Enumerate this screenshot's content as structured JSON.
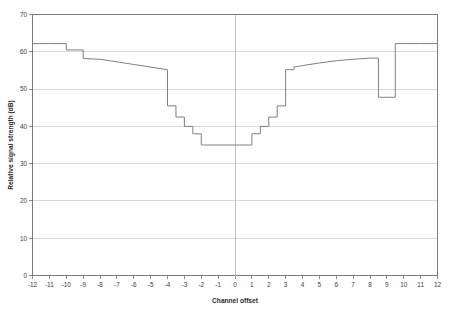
{
  "chart_data": {
    "type": "line",
    "title": "",
    "xlabel": "Channel offset",
    "ylabel": "Relative signal strength (dB)",
    "xlim": [
      -12,
      12
    ],
    "ylim": [
      0,
      70
    ],
    "xticks": [
      "-12",
      "-11",
      "-10",
      "-9",
      "-8",
      "-7",
      "-6",
      "-5",
      "-4",
      "-3",
      "-2",
      "-1",
      "0",
      "1",
      "2",
      "3",
      "4",
      "5",
      "6",
      "7",
      "8",
      "9",
      "10",
      "11",
      "12"
    ],
    "yticks": [
      "0",
      "10",
      "20",
      "30",
      "40",
      "50",
      "60",
      "70"
    ],
    "grid": "horizontal",
    "legend": "none",
    "series": [
      {
        "name": "Relative signal strength",
        "line_color": "#808080",
        "style": "step-with-ramps",
        "x": [
          -12,
          -11,
          -10,
          -10,
          -9,
          -9,
          -8,
          -7,
          -6,
          -5,
          -4,
          -4,
          -3.5,
          -3.5,
          -3,
          -3,
          -2.5,
          -2.5,
          -2,
          -2,
          -1.5,
          -1.5,
          -1,
          0,
          0.5,
          0.5,
          1,
          1,
          1.5,
          1.5,
          2,
          2,
          2.5,
          2.5,
          3,
          3,
          3.5,
          3.5,
          4,
          5,
          6,
          7,
          8,
          8.5,
          8.5,
          9.5,
          9.5,
          10,
          11,
          12
        ],
        "y": [
          62.2,
          62.2,
          62.2,
          60.5,
          60.5,
          58.2,
          58.0,
          57.3,
          56.6,
          55.9,
          55.2,
          45.5,
          45.5,
          42.5,
          42.5,
          40.0,
          40.0,
          38.0,
          38.0,
          35.0,
          35.0,
          35.0,
          35.0,
          35.0,
          35.0,
          35.0,
          35.0,
          38.0,
          38.0,
          40.0,
          40.0,
          42.5,
          42.5,
          45.5,
          45.5,
          55.2,
          55.2,
          55.9,
          56.3,
          57.0,
          57.6,
          58.0,
          58.3,
          58.3,
          47.8,
          47.8,
          62.2,
          62.2,
          62.2,
          62.2
        ]
      }
    ],
    "annotations": []
  }
}
